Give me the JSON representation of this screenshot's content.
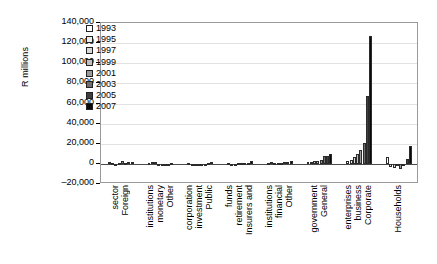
{
  "chart_data": {
    "type": "bar",
    "title": "",
    "xlabel": "",
    "ylabel": "R millions",
    "ylim": [
      -20000,
      140000
    ],
    "ytick_step": 20000,
    "grid": true,
    "legend_position": "top-left-inside",
    "yticks": [
      "140,000",
      "120,000",
      "100,000",
      "80,000",
      "60,000",
      "40,000",
      "20,000",
      "0",
      "–20,000"
    ],
    "categories": [
      "Foreign sector",
      "Other monetary institutions",
      "Public investment corporation",
      "Insurers and retirement funds",
      "Other financial institutions",
      "General government",
      "Corporate business enterprises",
      "Households"
    ],
    "category_lines": [
      [
        "Foreign",
        "sector"
      ],
      [
        "Other",
        "monetary",
        "institutions"
      ],
      [
        "Public",
        "investment",
        "corporation"
      ],
      [
        "Insurers and",
        "retirement",
        "funds"
      ],
      [
        "Other",
        "financial",
        "institutions"
      ],
      [
        "General",
        "government"
      ],
      [
        "Corporate",
        "business",
        "enterprises"
      ],
      [
        "Households"
      ]
    ],
    "series": [
      {
        "name": "1993",
        "color": "#ffffff",
        "values": [
          1800,
          600,
          400,
          900,
          500,
          2200,
          2500,
          6500
        ]
      },
      {
        "name": "1995",
        "color": "#ededed",
        "values": [
          500,
          1500,
          300,
          -400,
          2300,
          2300,
          4000,
          -3500
        ]
      },
      {
        "name": "1997",
        "color": "#d8d8d8",
        "values": [
          300,
          1900,
          200,
          -600,
          900,
          2500,
          6500,
          -4500
        ]
      },
      {
        "name": "1999",
        "color": "#c0c0c0",
        "values": [
          400,
          -1500,
          300,
          400,
          600,
          3200,
          9500,
          -2000
        ]
      },
      {
        "name": "2001",
        "color": "#9a9a9a",
        "values": [
          2600,
          -2000,
          200,
          700,
          400,
          4200,
          14000,
          -5500
        ]
      },
      {
        "name": "2003",
        "color": "#6e6e6e",
        "values": [
          600,
          -1800,
          300,
          500,
          1600,
          7500,
          21000,
          -1500
        ]
      },
      {
        "name": "2005",
        "color": "#3f3f3f",
        "values": [
          1500,
          -900,
          1200,
          600,
          2100,
          8200,
          67000,
          5000
        ]
      },
      {
        "name": "2007",
        "color": "#0a0a0a",
        "values": [
          2000,
          700,
          1500,
          2600,
          3000,
          10200,
          127000,
          18000
        ]
      }
    ]
  }
}
